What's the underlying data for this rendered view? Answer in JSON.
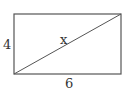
{
  "diagram": {
    "shape": "rectangle",
    "has_diagonal": true,
    "labels": {
      "height": "4",
      "width": "6",
      "diagonal": "x"
    },
    "stroke_color": "#555555"
  }
}
